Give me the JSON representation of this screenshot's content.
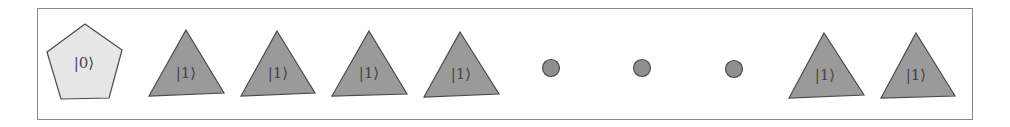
{
  "diagram": {
    "colors": {
      "frame": "#8a8a8a",
      "pentagon_fill": "#e6e6e6",
      "triangle_fill": "#9a9a9a",
      "dot_fill": "#8f8f8f",
      "stroke": "#4a4a4a"
    },
    "items": [
      {
        "shape": "pentagon",
        "label": "|0⟩",
        "cx": 85
      },
      {
        "shape": "triangle",
        "label": "|1⟩",
        "cx": 186
      },
      {
        "shape": "triangle",
        "label": "|1⟩",
        "cx": 278
      },
      {
        "shape": "triangle",
        "label": "|1⟩",
        "cx": 369
      },
      {
        "shape": "triangle",
        "label": "|1⟩",
        "cx": 461
      },
      {
        "shape": "dot",
        "label": "",
        "cx": 551
      },
      {
        "shape": "dot",
        "label": "",
        "cx": 642
      },
      {
        "shape": "dot",
        "label": "",
        "cx": 734
      },
      {
        "shape": "triangle",
        "label": "|1⟩",
        "cx": 825
      },
      {
        "shape": "triangle",
        "label": "|1⟩",
        "cx": 916
      }
    ]
  }
}
